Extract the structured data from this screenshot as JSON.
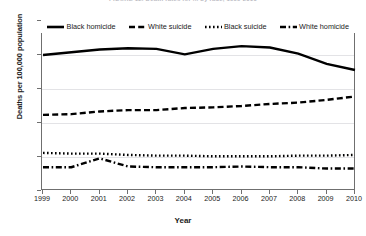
{
  "figure": {
    "title": "FIGURE 12. Death rates for ... by race, 1999-2010",
    "xlabel": "Year",
    "ylabel": "Deaths per 100,000 population"
  },
  "legend": {
    "position": "top-inside",
    "items": [
      {
        "label": "Black homicide",
        "style": "solid",
        "color": "#000000"
      },
      {
        "label": "White suicide",
        "style": "dashed",
        "color": "#000000"
      },
      {
        "label": "Black suicide",
        "style": "dotted",
        "color": "#000000"
      },
      {
        "label": "White homicide",
        "style": "dashdot",
        "color": "#000000"
      }
    ]
  },
  "axes": {
    "yticks": [
      "0",
      "5",
      "10",
      "15",
      "20",
      "25"
    ],
    "xticks": [
      "1999",
      "2000",
      "2001",
      "2002",
      "2003",
      "2004",
      "2005",
      "2006",
      "2007",
      "2008",
      "2009",
      "2010"
    ]
  },
  "chart_data": {
    "type": "line",
    "title": "FIGURE 12. Death rates for ... by race, 1999-2010",
    "xlabel": "Year",
    "ylabel": "Deaths per 100,000 population",
    "x": [
      1999,
      2000,
      2001,
      2002,
      2003,
      2004,
      2005,
      2006,
      2007,
      2008,
      2009,
      2010
    ],
    "xlim": [
      1999,
      2010
    ],
    "ylim": [
      0,
      25
    ],
    "grid": true,
    "legend_position": "top-inside",
    "series": [
      {
        "name": "Black homicide",
        "style": "solid",
        "color": "#000000",
        "values": [
          20.0,
          20.4,
          20.8,
          21.0,
          20.9,
          20.1,
          20.9,
          21.3,
          21.1,
          20.2,
          18.7,
          17.8
        ]
      },
      {
        "name": "White suicide",
        "style": "dashed",
        "color": "#000000",
        "values": [
          11.2,
          11.3,
          11.7,
          11.9,
          11.9,
          12.2,
          12.3,
          12.5,
          12.8,
          13.0,
          13.4,
          13.9
        ]
      },
      {
        "name": "Black suicide",
        "style": "dotted",
        "color": "#000000",
        "values": [
          5.6,
          5.5,
          5.5,
          5.3,
          5.2,
          5.2,
          5.1,
          5.1,
          5.1,
          5.2,
          5.2,
          5.3
        ]
      },
      {
        "name": "White homicide",
        "style": "dashdot",
        "color": "#000000",
        "values": [
          3.5,
          3.5,
          4.8,
          3.6,
          3.5,
          3.5,
          3.5,
          3.6,
          3.5,
          3.5,
          3.3,
          3.3
        ]
      }
    ]
  }
}
